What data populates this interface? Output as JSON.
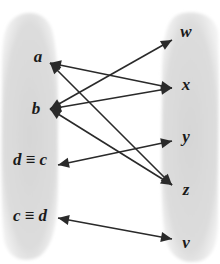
{
  "diagram": {
    "type": "mapping-diagram",
    "colors": {
      "blob": "#d9d9d9",
      "blob_edge": "#e8e8e8",
      "arrow": "#2a2a2a",
      "label": "#1a1a1a",
      "background": "#ffffff"
    },
    "left_set": {
      "nodes": [
        {
          "id": "a",
          "label": "a",
          "x": 38,
          "y": 62,
          "anchor_x": 50,
          "anchor_y": 63
        },
        {
          "id": "b",
          "label": "b",
          "x": 36,
          "y": 114,
          "anchor_x": 50,
          "anchor_y": 109
        },
        {
          "id": "dc",
          "label": "d ≡ c",
          "x": 30,
          "y": 165,
          "anchor_x": 58,
          "anchor_y": 165
        },
        {
          "id": "cd",
          "label": "c ≡ d",
          "x": 30,
          "y": 221,
          "anchor_x": 58,
          "anchor_y": 218
        }
      ]
    },
    "right_set": {
      "nodes": [
        {
          "id": "w",
          "label": "w",
          "x": 186,
          "y": 37,
          "anchor_x": 172,
          "anchor_y": 40
        },
        {
          "id": "x",
          "label": "x",
          "x": 186,
          "y": 90,
          "anchor_x": 172,
          "anchor_y": 88
        },
        {
          "id": "y",
          "label": "y",
          "x": 186,
          "y": 142,
          "anchor_x": 172,
          "anchor_y": 141
        },
        {
          "id": "z",
          "label": "z",
          "x": 186,
          "y": 195,
          "anchor_x": 172,
          "anchor_y": 185
        },
        {
          "id": "v",
          "label": "v",
          "x": 186,
          "y": 248,
          "anchor_x": 172,
          "anchor_y": 239
        }
      ]
    },
    "edges": [
      {
        "from": "a",
        "to": "x",
        "directed": "bidirectional"
      },
      {
        "from": "a",
        "to": "z",
        "directed": "bidirectional"
      },
      {
        "from": "b",
        "to": "w",
        "directed": "bidirectional"
      },
      {
        "from": "b",
        "to": "x",
        "directed": "bidirectional"
      },
      {
        "from": "b",
        "to": "z",
        "directed": "bidirectional"
      },
      {
        "from": "dc",
        "to": "y",
        "directed": "bidirectional"
      },
      {
        "from": "cd",
        "to": "v",
        "directed": "bidirectional"
      }
    ]
  }
}
